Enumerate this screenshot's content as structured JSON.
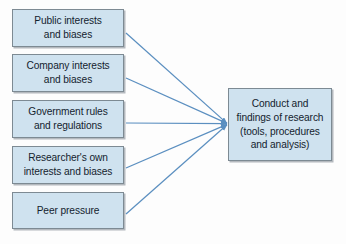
{
  "diagram": {
    "type": "influences-converging-flowchart",
    "background_color": "#fdfdfd",
    "node_fill_color": "#cfe2ef",
    "node_border_color": "#7d8a93",
    "arrow_color": "#5b8fc0",
    "source_nodes": [
      {
        "id": "public",
        "label": "Public interests\nand biases"
      },
      {
        "id": "company",
        "label": "Company interests\nand biases"
      },
      {
        "id": "government",
        "label": "Government rules\nand regulations"
      },
      {
        "id": "researcher",
        "label": "Researcher's own\ninterests and biases"
      },
      {
        "id": "peer",
        "label": "Peer pressure"
      }
    ],
    "target_node": {
      "id": "outcome",
      "label": "Conduct and\nfindings of research\n(tools, procedures\nand analysis)"
    },
    "connections": [
      {
        "from": "public",
        "to": "outcome",
        "arrowhead": true
      },
      {
        "from": "company",
        "to": "outcome",
        "arrowhead": true
      },
      {
        "from": "government",
        "to": "outcome",
        "arrowhead": true
      },
      {
        "from": "researcher",
        "to": "outcome",
        "arrowhead": true
      },
      {
        "from": "peer",
        "to": "outcome",
        "arrowhead": true
      }
    ],
    "convergence_point": {
      "x": 228,
      "y": 124
    }
  }
}
